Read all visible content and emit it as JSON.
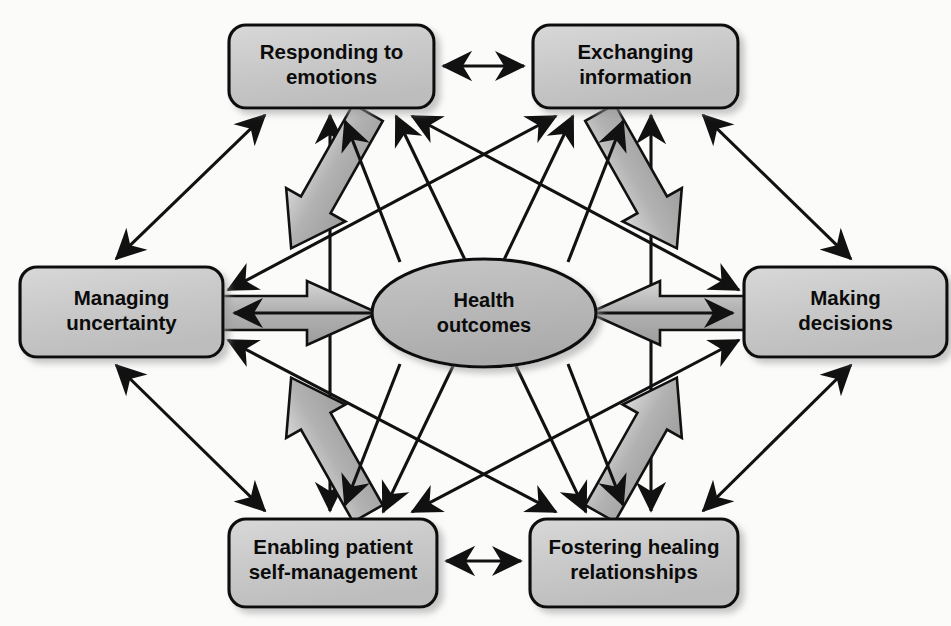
{
  "figure": {
    "center": {
      "id": "health-outcomes",
      "line1": "Health",
      "line2": "outcomes",
      "cx": 484,
      "cy": 313,
      "rx": 112,
      "ry": 54
    },
    "nodes": [
      {
        "id": "responding-to-emotions",
        "line1": "Responding to",
        "line2": "emotions",
        "x": 229,
        "y": 25,
        "w": 205,
        "h": 83
      },
      {
        "id": "exchanging-information",
        "line1": "Exchanging",
        "line2": "information",
        "x": 533,
        "y": 25,
        "w": 205,
        "h": 83
      },
      {
        "id": "managing-uncertainty",
        "line1": "Managing",
        "line2": "uncertainty",
        "x": 20,
        "y": 267,
        "w": 203,
        "h": 90
      },
      {
        "id": "making-decisions",
        "line1": "Making",
        "line2": "decisions",
        "x": 744,
        "y": 267,
        "w": 203,
        "h": 90
      },
      {
        "id": "enabling-patient-self-management",
        "line1": "Enabling patient",
        "line2": "self-management",
        "x": 229,
        "y": 519,
        "w": 208,
        "h": 88
      },
      {
        "id": "fostering-healing-relationships",
        "line1": "Fostering healing",
        "line2": "relationships",
        "x": 530,
        "y": 519,
        "w": 208,
        "h": 88
      }
    ],
    "colors": {
      "node_fill": "#c6c6c6",
      "node_fill_light": "#d6d6d6",
      "center_fill": "#b8b8b8",
      "block_arrow_fill": "#a9a9a9",
      "block_arrow_fill_light": "#cfcfcf",
      "stroke": "#111111",
      "background": "#fbfbfa",
      "shadow": "#c9c9c9"
    },
    "connections": {
      "block_arrows_to_center": [
        {
          "from": "responding-to-emotions",
          "to": "health-outcomes",
          "direction": "to-center"
        },
        {
          "from": "exchanging-information",
          "to": "health-outcomes",
          "direction": "to-center"
        },
        {
          "from": "managing-uncertainty",
          "to": "health-outcomes",
          "direction": "to-center"
        },
        {
          "from": "making-decisions",
          "to": "health-outcomes",
          "direction": "to-center"
        },
        {
          "from": "enabling-patient-self-management",
          "to": "health-outcomes",
          "direction": "to-center"
        },
        {
          "from": "fostering-healing-relationships",
          "to": "health-outcomes",
          "direction": "to-center"
        }
      ],
      "thin_return_arrows": [
        {
          "from": "health-outcomes",
          "to": "responding-to-emotions"
        },
        {
          "from": "health-outcomes",
          "to": "exchanging-information"
        },
        {
          "from": "health-outcomes",
          "to": "managing-uncertainty"
        },
        {
          "from": "health-outcomes",
          "to": "making-decisions"
        },
        {
          "from": "health-outcomes",
          "to": "enabling-patient-self-management"
        },
        {
          "from": "health-outcomes",
          "to": "fostering-healing-relationships"
        }
      ],
      "bidirectional_between_nodes": [
        {
          "a": "responding-to-emotions",
          "b": "exchanging-information"
        },
        {
          "a": "responding-to-emotions",
          "b": "managing-uncertainty"
        },
        {
          "a": "responding-to-emotions",
          "b": "making-decisions"
        },
        {
          "a": "responding-to-emotions",
          "b": "enabling-patient-self-management"
        },
        {
          "a": "responding-to-emotions",
          "b": "fostering-healing-relationships"
        },
        {
          "a": "exchanging-information",
          "b": "managing-uncertainty"
        },
        {
          "a": "exchanging-information",
          "b": "making-decisions"
        },
        {
          "a": "exchanging-information",
          "b": "enabling-patient-self-management"
        },
        {
          "a": "exchanging-information",
          "b": "fostering-healing-relationships"
        },
        {
          "a": "managing-uncertainty",
          "b": "enabling-patient-self-management"
        },
        {
          "a": "managing-uncertainty",
          "b": "fostering-healing-relationships"
        },
        {
          "a": "making-decisions",
          "b": "enabling-patient-self-management"
        },
        {
          "a": "making-decisions",
          "b": "fostering-healing-relationships"
        },
        {
          "a": "enabling-patient-self-management",
          "b": "fostering-healing-relationships"
        }
      ]
    }
  }
}
